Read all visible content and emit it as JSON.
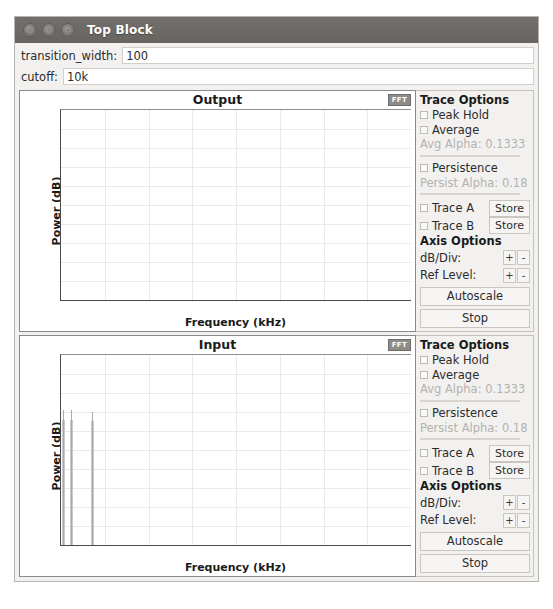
{
  "window": {
    "title": "Top Block",
    "controls": [
      "close-button",
      "minimize-button",
      "maximize-button"
    ]
  },
  "params": [
    {
      "label": "transition_width:",
      "value": "100"
    },
    {
      "label": "cutoff:",
      "value": "10k"
    }
  ],
  "panes": [
    {
      "id": "output",
      "title": "Output",
      "tab_label": "FFT",
      "chart_data": {
        "type": "line",
        "title": "Output",
        "xlabel": "Frequency (kHz)",
        "ylabel": "Power (dB)",
        "xlim": [
          0,
          16
        ],
        "ylim": [
          -100,
          0
        ],
        "xticks": [
          0,
          2,
          4,
          6,
          8,
          10,
          12,
          14,
          16
        ],
        "yticks": [
          0,
          -10,
          -20,
          -30,
          -40,
          -50,
          -60,
          -70,
          -80,
          -90,
          -100
        ],
        "grid": true,
        "series": [
          {
            "name": "Output spectrum",
            "peaks": []
          }
        ]
      },
      "trace_options": {
        "header": "Trace Options",
        "peak_hold": "Peak Hold",
        "average": "Average",
        "avg_alpha": "Avg Alpha: 0.1333",
        "persistence": "Persistence",
        "persist_alpha": "Persist Alpha: 0.18",
        "trace_a": "Trace A",
        "trace_b": "Trace B",
        "store": "Store",
        "axis_header": "Axis Options",
        "db_div": "dB/Div:",
        "ref_level": "Ref Level:",
        "plus": "+",
        "minus": "-",
        "autoscale": "Autoscale",
        "stop": "Stop"
      }
    },
    {
      "id": "input",
      "title": "Input",
      "tab_label": "FFT",
      "chart_data": {
        "type": "line",
        "title": "Input",
        "xlabel": "Frequency (kHz)",
        "ylabel": "Power (dB)",
        "xlim": [
          0,
          16
        ],
        "ylim": [
          -100,
          0
        ],
        "xticks": [
          0,
          2,
          4,
          6,
          8,
          10,
          12,
          14,
          16
        ],
        "yticks": [
          0,
          -10,
          -20,
          -30,
          -40,
          -50,
          -60,
          -70,
          -80,
          -90,
          -100
        ],
        "grid": true,
        "series": [
          {
            "name": "Input spectrum",
            "peaks": [
              {
                "freq_khz": 0.1,
                "power_db": -29
              },
              {
                "freq_khz": 0.45,
                "power_db": -29
              },
              {
                "freq_khz": 1.4,
                "power_db": -30
              }
            ]
          }
        ]
      },
      "trace_options": {
        "header": "Trace Options",
        "peak_hold": "Peak Hold",
        "average": "Average",
        "avg_alpha": "Avg Alpha: 0.1333",
        "persistence": "Persistence",
        "persist_alpha": "Persist Alpha: 0.18",
        "trace_a": "Trace A",
        "trace_b": "Trace B",
        "store": "Store",
        "axis_header": "Axis Options",
        "db_div": "dB/Div:",
        "ref_level": "Ref Level:",
        "plus": "+",
        "minus": "-",
        "autoscale": "Autoscale",
        "stop": "Stop"
      }
    }
  ],
  "colors": {
    "titlebar": "#6b6864",
    "window_bg": "#f2f1f0",
    "plot_bg": "#ffffff",
    "grid": "#e9e9ec",
    "trace": "#a9a9ad",
    "axis": "#4a4a4a"
  }
}
